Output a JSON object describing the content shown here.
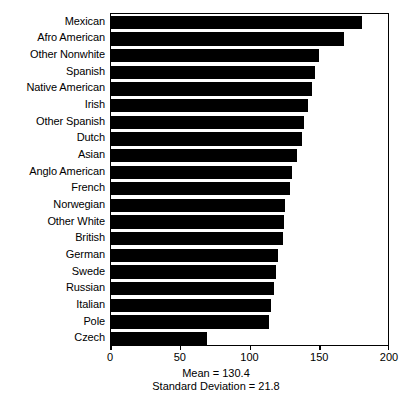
{
  "chart_data": {
    "type": "bar",
    "orientation": "horizontal",
    "title": "",
    "xlabel": "",
    "ylabel": "",
    "xlim": [
      0,
      200
    ],
    "xticks": [
      0,
      50,
      100,
      150,
      200
    ],
    "xtick_labels": [
      "0",
      "50",
      "100",
      "150",
      "200"
    ],
    "grid": false,
    "legend": false,
    "bar_color": "#000000",
    "background_color": "#ffffff",
    "categories": [
      "Mexican",
      "Afro American",
      "Other Nonwhite",
      "Spanish",
      "Native American",
      "Irish",
      "Other Spanish",
      "Dutch",
      "Asian",
      "Anglo American",
      "French",
      "Norwegian",
      "Other White",
      "British",
      "German",
      "Swede",
      "Russian",
      "Italian",
      "Pole",
      "Czech"
    ],
    "values": [
      180,
      167,
      149,
      146,
      144,
      141,
      138,
      137,
      133,
      130,
      128,
      125,
      124,
      123,
      120,
      118,
      117,
      115,
      113,
      69
    ],
    "annotations": [
      "Mean = 130.4",
      "Standard Deviation = 21.8"
    ]
  },
  "caption": {
    "mean_line": "Mean = 130.4",
    "sd_line": "Standard Deviation = 21.8"
  }
}
